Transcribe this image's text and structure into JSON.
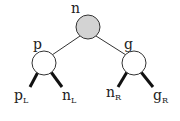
{
  "diagram": {
    "type": "binary-tree",
    "colors": {
      "root_fill": "#d3d3d3",
      "node_fill": "#ffffff",
      "stroke": "#222222"
    },
    "nodes": [
      {
        "id": "n",
        "label": "n",
        "fill": "gray"
      },
      {
        "id": "p",
        "label": "p",
        "fill": "white"
      },
      {
        "id": "g",
        "label": "g",
        "fill": "white"
      }
    ],
    "subtrees": [
      {
        "id": "pL",
        "base": "p",
        "sub": "L"
      },
      {
        "id": "nL",
        "base": "n",
        "sub": "L"
      },
      {
        "id": "nR",
        "base": "n",
        "sub": "R"
      },
      {
        "id": "gR",
        "base": "g",
        "sub": "R"
      }
    ],
    "edges": [
      {
        "from": "n",
        "to": "p",
        "style": "thin"
      },
      {
        "from": "n",
        "to": "g",
        "style": "thin"
      },
      {
        "from": "p",
        "to": "pL",
        "style": "thick"
      },
      {
        "from": "p",
        "to": "nL",
        "style": "thick"
      },
      {
        "from": "g",
        "to": "nR",
        "style": "thick"
      },
      {
        "from": "g",
        "to": "gR",
        "style": "thick"
      }
    ]
  }
}
